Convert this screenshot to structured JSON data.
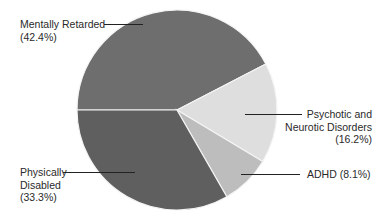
{
  "chart_data": {
    "type": "pie",
    "title": "",
    "start_angle_deg": 180,
    "direction": "clockwise",
    "center": [
      177,
      110
    ],
    "radius": 100,
    "slices": [
      {
        "name": "Mentally Retarded",
        "value": 42.4,
        "label": "(42.4%)",
        "color": "#6e6e6e"
      },
      {
        "name": "Psychotic and Neurotic Disorders",
        "value": 16.2,
        "label": "(16.2%)",
        "color": "#dedede"
      },
      {
        "name": "ADHD",
        "value": 8.1,
        "label": "(8.1%)",
        "color": "#bdbdbd"
      },
      {
        "name": "Physically Disabled",
        "value": 33.3,
        "label": "(33.3%)",
        "color": "#5f5f5f"
      }
    ],
    "legend": "none (callout labels)"
  },
  "labels": {
    "mr": {
      "line1": "Mentally Retarded",
      "line2": "(42.4%)"
    },
    "pnd": {
      "line1": "Psychotic and",
      "line2": "Neurotic Disorders",
      "line3": "(16.2%)"
    },
    "adhd": {
      "line1": "ADHD (8.1%)"
    },
    "pd": {
      "line1": "Physically",
      "line2": "Disabled",
      "line3": "(33.3%)"
    }
  }
}
